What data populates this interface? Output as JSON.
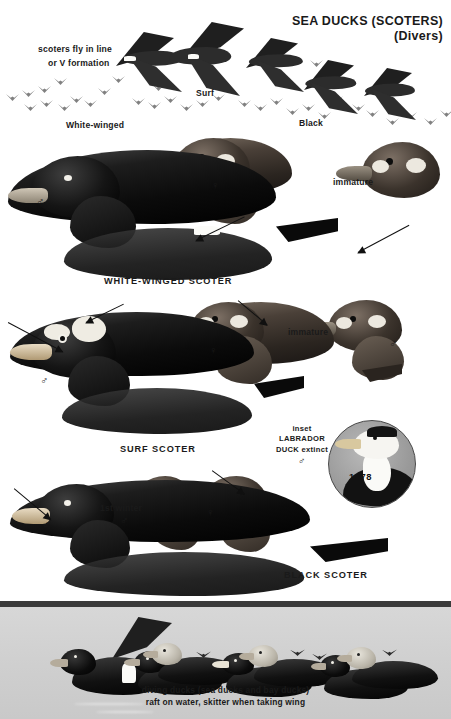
{
  "page": {
    "title_line1": "SEA DUCKS (SCOTERS)",
    "title_line2": "(Divers)",
    "background": "#ffffff"
  },
  "flight_section": {
    "formation_note_line1": "scoters fly in line",
    "formation_note_line2": "or V formation",
    "labels": [
      {
        "text": "White-winged",
        "x": 66,
        "y": 120
      },
      {
        "text": "Surf",
        "x": 196,
        "y": 88
      },
      {
        "text": "Black",
        "x": 299,
        "y": 118
      }
    ]
  },
  "plates": [
    {
      "name": "WHITE-WINGED SCOTER",
      "species_label": "WHITE-WINGED SCOTER",
      "annotations": [
        {
          "text": "♂",
          "x": 36,
          "y": 196,
          "kind": "male-symbol"
        },
        {
          "text": "♀",
          "x": 211,
          "y": 180,
          "kind": "female-symbol"
        },
        {
          "text": "immature",
          "x": 333,
          "y": 177,
          "kind": "age-label"
        }
      ]
    },
    {
      "name": "SURF SCOTER",
      "species_label": "SURF SCOTER",
      "annotations": [
        {
          "text": "♂",
          "x": 40,
          "y": 375,
          "kind": "male-symbol"
        },
        {
          "text": "♀",
          "x": 209,
          "y": 345,
          "kind": "female-symbol"
        },
        {
          "text": "immature",
          "x": 288,
          "y": 327,
          "kind": "age-label"
        },
        {
          "text": "♂",
          "x": 389,
          "y": 338,
          "kind": "male-symbol"
        }
      ]
    },
    {
      "name": "BLACK SCOTER",
      "species_label": "BLACK SCOTER",
      "annotations": [
        {
          "text": "♂",
          "x": 42,
          "y": 519,
          "kind": "male-symbol"
        },
        {
          "text": "1st winter",
          "x": 100,
          "y": 503,
          "kind": "age-label"
        },
        {
          "text": "♂",
          "x": 120,
          "y": 517,
          "kind": "male-symbol"
        },
        {
          "text": "♀",
          "x": 206,
          "y": 509,
          "kind": "female-symbol"
        }
      ]
    }
  ],
  "inset": {
    "line1": "inset",
    "line2": "LABRADOR",
    "line3": "DUCK extinct",
    "line4": "♂",
    "year": "1878"
  },
  "bottom_panel": {
    "caption_line1": "diving ducks (sea ducks and bay ducks)",
    "caption_line2": "raft on water, skitter when taking wing",
    "background": "#d2d2d2",
    "bar_color": "#3b3b3b"
  },
  "colors": {
    "ink": "#1a1a1a",
    "plumage_dark": "#0b0b0b",
    "plumage_brown": "#4a4038",
    "bill_pale": "#cfc6b6",
    "inset_fill": "#9a9a9a"
  }
}
